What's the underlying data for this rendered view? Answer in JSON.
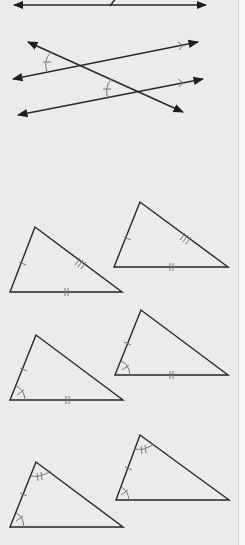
{
  "figure": {
    "title": "",
    "colors": {
      "background": "#ebebeb",
      "line": "#2a2a2a",
      "marks": "#777777"
    },
    "parts": [
      {
        "id": "top-line",
        "description": "line with arrows at both ends, partial crossing segment"
      },
      {
        "id": "parallel-lines",
        "description": "two parallel lines (marked with > arrows) cut by a transversal, corresponding angles marked congruent"
      },
      {
        "id": "triangle-pair-sss",
        "description": "two triangles with three pairs of congruent sides (|, ||, |||)"
      },
      {
        "id": "triangle-pair-sas",
        "description": "two triangles with two congruent sides and the included angle congruent"
      },
      {
        "id": "triangle-pair-asa",
        "description": "two triangles with two congruent angles and the included side congruent"
      }
    ]
  }
}
